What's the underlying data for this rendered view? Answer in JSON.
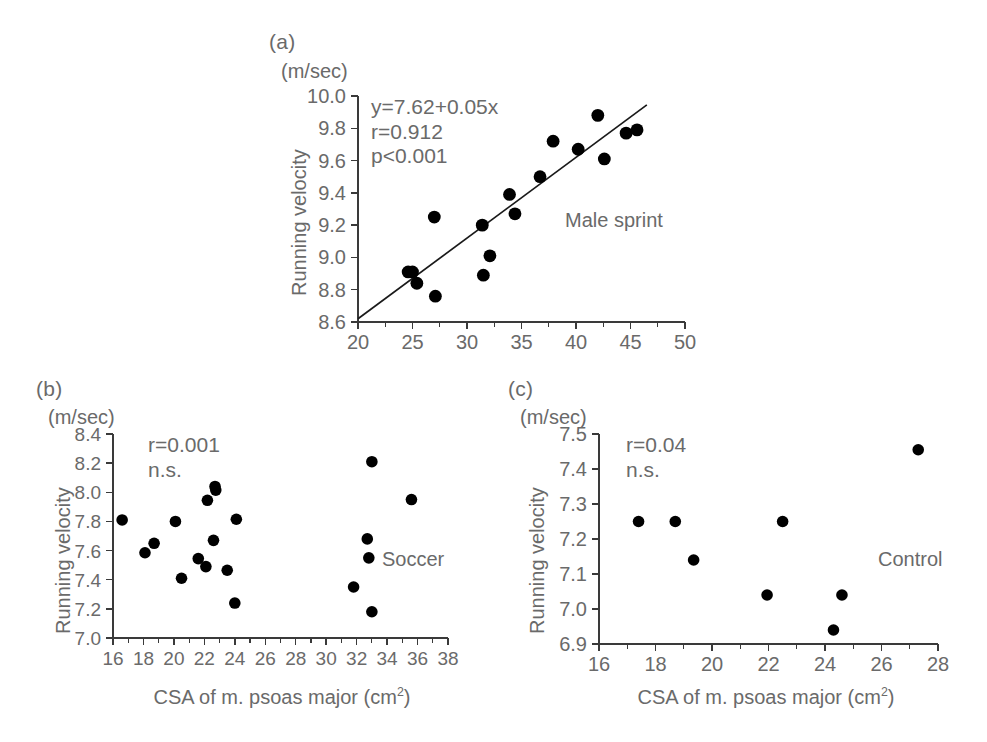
{
  "figure": {
    "background_color": "#ffffff",
    "text_color": "#6a6a6a",
    "point_color": "#000000"
  },
  "panels": {
    "a": {
      "letter": "(a)",
      "unit_label": "(m/sec)",
      "ylabel": "Running velocity",
      "group_label": "Male sprint",
      "stats": {
        "equation": "y=7.62+0.05x",
        "r": "r=0.912",
        "p": "p<0.001"
      }
    },
    "b": {
      "letter": "(b)",
      "unit_label": "(m/sec)",
      "ylabel": "Running velocity",
      "xlabel_main": "CSA of m. psoas major  (cm",
      "xlabel_sup": "2",
      "xlabel_end": ")",
      "group_label": "Soccer",
      "stats": {
        "r": "r=0.001",
        "ns": "n.s."
      }
    },
    "c": {
      "letter": "(c)",
      "unit_label": "(m/sec)",
      "ylabel": "Running velocity",
      "xlabel_main": "CSA of m. psoas major  (cm",
      "xlabel_sup": "2",
      "xlabel_end": ")",
      "group_label": "Control",
      "stats": {
        "r": "r=0.04",
        "ns": "n.s."
      }
    }
  },
  "chart_data": [
    {
      "id": "panel-a",
      "type": "scatter",
      "title": "(a) Male sprint",
      "xlabel": "",
      "ylabel": "Running velocity",
      "yunit": "(m/sec)",
      "xlim": [
        20,
        50
      ],
      "ylim": [
        8.6,
        10.0
      ],
      "xticks": [
        20,
        25,
        30,
        35,
        40,
        45,
        50
      ],
      "xticklabels": [
        "20",
        "25",
        "30",
        "35",
        "40",
        "45",
        "50"
      ],
      "xminor_step": 2.5,
      "yticks": [
        8.6,
        8.8,
        9.0,
        9.2,
        9.4,
        9.6,
        9.8,
        10.0
      ],
      "yticklabels": [
        "8.6",
        "8.8",
        "9.0",
        "9.2",
        "9.4",
        "9.6",
        "9.8",
        "10.0"
      ],
      "grid": false,
      "legend": false,
      "annotations": [
        "y=7.62+0.05x",
        "r=0.912",
        "p<0.001",
        "Male sprint"
      ],
      "regression": {
        "equation": "y=7.62+0.05x",
        "intercept": 7.62,
        "slope": 0.05,
        "r": 0.912,
        "p": "<0.001",
        "x_start": 20.0,
        "x_end": 46.5
      },
      "points": [
        {
          "x": 24.6,
          "y": 8.91
        },
        {
          "x": 25.0,
          "y": 8.91
        },
        {
          "x": 25.4,
          "y": 8.84
        },
        {
          "x": 27.0,
          "y": 9.25
        },
        {
          "x": 27.1,
          "y": 8.76
        },
        {
          "x": 31.4,
          "y": 9.2
        },
        {
          "x": 31.5,
          "y": 8.89
        },
        {
          "x": 32.1,
          "y": 9.01
        },
        {
          "x": 33.9,
          "y": 9.39
        },
        {
          "x": 34.4,
          "y": 9.27
        },
        {
          "x": 36.7,
          "y": 9.5
        },
        {
          "x": 37.9,
          "y": 9.72
        },
        {
          "x": 40.2,
          "y": 9.67
        },
        {
          "x": 42.0,
          "y": 9.88
        },
        {
          "x": 42.6,
          "y": 9.61
        },
        {
          "x": 44.6,
          "y": 9.77
        },
        {
          "x": 45.6,
          "y": 9.79
        }
      ]
    },
    {
      "id": "panel-b",
      "type": "scatter",
      "title": "(b) Soccer",
      "xlabel": "CSA of m. psoas major  (cm2)",
      "ylabel": "Running velocity",
      "yunit": "(m/sec)",
      "xlim": [
        16,
        38
      ],
      "ylim": [
        7.0,
        8.4
      ],
      "xticks": [
        16,
        18,
        20,
        22,
        24,
        26,
        28,
        30,
        32,
        34,
        36,
        38
      ],
      "xticklabels": [
        "16",
        "18",
        "20",
        "22",
        "24",
        "26",
        "28",
        "30",
        "32",
        "34",
        "36",
        "38"
      ],
      "xminor_step": 1,
      "yticks": [
        7.0,
        7.2,
        7.4,
        7.6,
        7.8,
        8.0,
        8.2,
        8.4
      ],
      "yticklabels": [
        "7.0",
        "7.2",
        "7.4",
        "7.6",
        "7.8",
        "8.0",
        "8.2",
        "8.4"
      ],
      "grid": false,
      "legend": false,
      "annotations": [
        "r=0.001",
        "n.s.",
        "Soccer"
      ],
      "statistics": {
        "r": 0.001,
        "significance": "n.s."
      },
      "points": [
        {
          "x": 16.6,
          "y": 7.81
        },
        {
          "x": 18.1,
          "y": 7.585
        },
        {
          "x": 18.7,
          "y": 7.65
        },
        {
          "x": 20.1,
          "y": 7.8
        },
        {
          "x": 20.5,
          "y": 7.41
        },
        {
          "x": 21.6,
          "y": 7.545
        },
        {
          "x": 22.2,
          "y": 7.945
        },
        {
          "x": 22.1,
          "y": 7.49
        },
        {
          "x": 22.7,
          "y": 8.04
        },
        {
          "x": 22.75,
          "y": 8.015
        },
        {
          "x": 22.6,
          "y": 7.67
        },
        {
          "x": 23.5,
          "y": 7.465
        },
        {
          "x": 24.1,
          "y": 7.815
        },
        {
          "x": 24.0,
          "y": 7.24
        },
        {
          "x": 31.8,
          "y": 7.35
        },
        {
          "x": 32.7,
          "y": 7.68
        },
        {
          "x": 32.8,
          "y": 7.55
        },
        {
          "x": 33.0,
          "y": 8.21
        },
        {
          "x": 33.0,
          "y": 7.18
        },
        {
          "x": 35.6,
          "y": 7.95
        }
      ]
    },
    {
      "id": "panel-c",
      "type": "scatter",
      "title": "(c) Control",
      "xlabel": "CSA of m. psoas major  (cm2)",
      "ylabel": "Running velocity",
      "yunit": "(m/sec)",
      "xlim": [
        16,
        28
      ],
      "ylim": [
        6.9,
        7.5
      ],
      "xticks": [
        16,
        18,
        20,
        22,
        24,
        26,
        28
      ],
      "xticklabels": [
        "16",
        "18",
        "20",
        "22",
        "24",
        "26",
        "28"
      ],
      "xminor_step": 1,
      "yticks": [
        6.9,
        7.0,
        7.1,
        7.2,
        7.3,
        7.4,
        7.5
      ],
      "yticklabels": [
        "6.9",
        "7.0",
        "7.1",
        "7.2",
        "7.3",
        "7.4",
        "7.5"
      ],
      "grid": false,
      "legend": false,
      "annotations": [
        "r=0.04",
        "n.s.",
        "Control"
      ],
      "statistics": {
        "r": 0.04,
        "significance": "n.s."
      },
      "points": [
        {
          "x": 17.4,
          "y": 7.25
        },
        {
          "x": 18.7,
          "y": 7.25
        },
        {
          "x": 19.35,
          "y": 7.14
        },
        {
          "x": 21.95,
          "y": 7.04
        },
        {
          "x": 22.5,
          "y": 7.25
        },
        {
          "x": 24.3,
          "y": 6.94
        },
        {
          "x": 24.6,
          "y": 7.04
        },
        {
          "x": 27.3,
          "y": 7.455
        }
      ]
    }
  ]
}
